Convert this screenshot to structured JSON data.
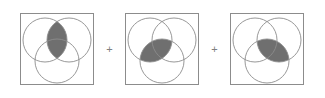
{
  "figure": {
    "title": "",
    "operators": [
      {
        "symbol": "+",
        "name": "plus"
      },
      {
        "symbol": "+",
        "name": "plus"
      }
    ],
    "style": {
      "frame_stroke": "#8c8c8c",
      "circle_stroke": "#8c8c8c",
      "shade_fill": "#6f6f6f",
      "shade_stroke": "#555555",
      "background": "#ffffff",
      "operator_color": "#808080"
    },
    "geometry": {
      "frame": {
        "x": 3,
        "y": 3,
        "width": 74,
        "height": 72
      },
      "circle_radius": 22,
      "circles": [
        {
          "id": "A",
          "label": "left-top-circle",
          "cx": 28,
          "cy": 30
        },
        {
          "id": "B",
          "label": "right-top-circle",
          "cx": 52,
          "cy": 30
        },
        {
          "id": "C",
          "label": "bottom-circle",
          "cx": 40,
          "cy": 51
        }
      ]
    },
    "panels": [
      {
        "name": "venn-diagram-ab",
        "shaded_region": "A∩B",
        "shaded_label": "top lens",
        "circles": [
          "A",
          "B",
          "C"
        ]
      },
      {
        "name": "venn-diagram-ac",
        "shaded_region": "A∩C",
        "shaded_label": "lower-left lens",
        "circles": [
          "A",
          "B",
          "C"
        ]
      },
      {
        "name": "venn-diagram-bc",
        "shaded_region": "B∩C",
        "shaded_label": "lower-right lens",
        "circles": [
          "A",
          "B",
          "C"
        ]
      }
    ]
  }
}
